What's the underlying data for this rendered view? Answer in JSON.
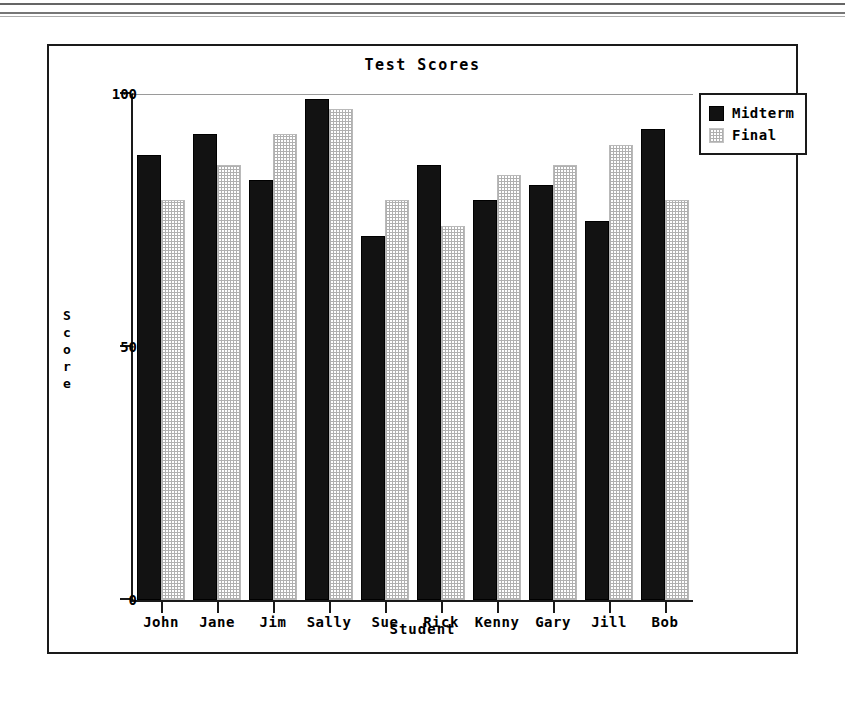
{
  "chart_data": {
    "type": "bar",
    "title": "Test Scores",
    "xlabel": "Student",
    "ylabel": "Score",
    "ylim": [
      0,
      100
    ],
    "yticks": [
      "0",
      "50",
      "100"
    ],
    "ytick_values": [
      0,
      50,
      100
    ],
    "grid": false,
    "legend_position": "top-right",
    "categories": [
      "John",
      "Jane",
      "Jim",
      "Sally",
      "Sue",
      "Rick",
      "Kenny",
      "Gary",
      "Jill",
      "Bob"
    ],
    "series": [
      {
        "name": "Midterm",
        "color": "#121212",
        "values": [
          88,
          92,
          83,
          99,
          72,
          86,
          79,
          82,
          75,
          93
        ]
      },
      {
        "name": "Final",
        "color": "#e8e8e8",
        "values": [
          79,
          86,
          92,
          97,
          79,
          74,
          84,
          86,
          90,
          79
        ]
      }
    ]
  },
  "axes": {
    "y_title_letters": [
      "S",
      "c",
      "o",
      "r",
      "e"
    ]
  },
  "legend": {
    "entries": [
      {
        "label": "Midterm",
        "swatch": "solid-black-square-icon"
      },
      {
        "label": "Final",
        "swatch": "stippled-square-icon"
      }
    ]
  }
}
